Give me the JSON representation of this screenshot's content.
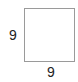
{
  "diagram": {
    "shape": "square",
    "side_labels": {
      "left": "9",
      "bottom": "9"
    },
    "colors": {
      "stroke": "#9a9a9a",
      "text": "#222222",
      "background": "#ffffff"
    }
  }
}
